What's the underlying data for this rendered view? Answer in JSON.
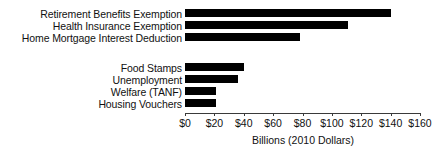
{
  "chart_data": {
    "type": "bar",
    "orientation": "horizontal",
    "title": "",
    "xlabel": "Billions (2010 Dollars)",
    "ylabel": "",
    "xlim": [
      0,
      160
    ],
    "grid": false,
    "legend": null,
    "bar_color": "#000000",
    "axis_color": "#3a3a3a",
    "tick_labels": [
      "$0",
      "$20",
      "$40",
      "$60",
      "$80",
      "$100",
      "$120",
      "$140",
      "$160"
    ],
    "tick_values": [
      0,
      20,
      40,
      60,
      80,
      100,
      120,
      140,
      160
    ],
    "categories": [
      "Retirement Benefits Exemption",
      "Health Insurance Exemption",
      "Home Mortgage Interest Deduction",
      "",
      "Food Stamps",
      "Unemployment",
      "Welfare (TANF)",
      "Housing Vouchers"
    ],
    "values": [
      140,
      111,
      78,
      null,
      40,
      36,
      21,
      21
    ],
    "groups": [
      {
        "name": "Tax Expenditures",
        "categories": [
          "Retirement Benefits Exemption",
          "Health Insurance Exemption",
          "Home Mortgage Interest Deduction"
        ],
        "values": [
          140,
          111,
          78
        ]
      },
      {
        "name": "Direct Spending Programs",
        "categories": [
          "Food Stamps",
          "Unemployment",
          "Welfare (TANF)",
          "Housing Vouchers"
        ],
        "values": [
          40,
          36,
          21,
          21
        ]
      }
    ]
  }
}
